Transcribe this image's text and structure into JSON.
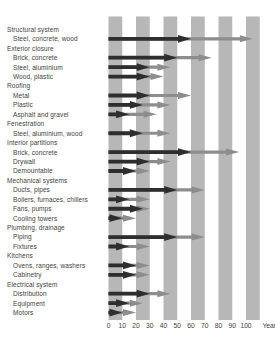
{
  "chart_data": {
    "type": "bar",
    "subtype": "arrow-range",
    "title": "",
    "xlabel": "Year",
    "unit_label": "Year",
    "x_ticks": [
      0,
      10,
      20,
      30,
      40,
      50,
      60,
      70,
      80,
      90,
      100
    ],
    "x_axis_range": [
      0,
      110
    ],
    "grid": "alternating vertical decade bands",
    "band_decades": [
      [
        0,
        10
      ],
      [
        20,
        30
      ],
      [
        40,
        50
      ],
      [
        60,
        70
      ],
      [
        80,
        90
      ],
      [
        100,
        110
      ]
    ],
    "legend_position": "none",
    "series_meaning": {
      "typical": "dark arrow - typical service life (years)",
      "maximum": "gray arrow - maximum service life (years)"
    },
    "groups": [
      {
        "label": "Structural system",
        "items": [
          {
            "label": "Steel, concrete, wood",
            "typical": 60,
            "maximum": 105
          }
        ]
      },
      {
        "label": "Exterior closure",
        "items": [
          {
            "label": "Brick, concrete",
            "typical": 50,
            "maximum": 75
          },
          {
            "label": "Steel, aluminium",
            "typical": 30,
            "maximum": 45
          },
          {
            "label": "Wood, plastic",
            "typical": 30,
            "maximum": 40
          }
        ]
      },
      {
        "label": "Roofing",
        "items": [
          {
            "label": "Metal",
            "typical": 30,
            "maximum": 60
          },
          {
            "label": "Plastic",
            "typical": 25,
            "maximum": 45
          },
          {
            "label": "Asphalt and gravel",
            "typical": 15,
            "maximum": 35
          }
        ]
      },
      {
        "label": "Fenestration",
        "items": [
          {
            "label": "Steel, aluminium, wood",
            "typical": 25,
            "maximum": 45
          }
        ]
      },
      {
        "label": "Interior partitions",
        "items": [
          {
            "label": "Brick, concrete",
            "typical": 60,
            "maximum": 95
          },
          {
            "label": "Drywall",
            "typical": 30,
            "maximum": 45
          },
          {
            "label": "Demountable",
            "typical": 20,
            "maximum": 30
          }
        ]
      },
      {
        "label": "Mechanical systems",
        "items": [
          {
            "label": "Ducts, pipes",
            "typical": 50,
            "maximum": 70
          },
          {
            "label": "Boilers, furnaces, chillers",
            "typical": 15,
            "maximum": 30
          },
          {
            "label": "Fans, pumps",
            "typical": 25,
            "maximum": 30
          },
          {
            "label": "Cooling towers",
            "typical": 10,
            "maximum": 20
          }
        ]
      },
      {
        "label": "Plumbing, drainage",
        "items": [
          {
            "label": "Piping",
            "typical": 50,
            "maximum": 70
          },
          {
            "label": "Fixtures",
            "typical": 15,
            "maximum": 30
          }
        ]
      },
      {
        "label": "Kitchens",
        "items": [
          {
            "label": "Ovens, ranges, washers",
            "typical": 20,
            "maximum": 30
          },
          {
            "label": "Cabinetry",
            "typical": 20,
            "maximum": 30
          }
        ]
      },
      {
        "label": "Electrical system",
        "items": [
          {
            "label": "Distribution",
            "typical": 30,
            "maximum": 45
          },
          {
            "label": "Equipment",
            "typical": 15,
            "maximum": 25
          },
          {
            "label": "Motors",
            "typical": 10,
            "maximum": 20
          }
        ]
      }
    ],
    "colors": {
      "typical_arrow": "#2e2e2e",
      "maximum_arrow": "#8d8d8d",
      "band": "#b7b7b7",
      "background": "#ffffff",
      "text": "#3d3d3d"
    }
  }
}
